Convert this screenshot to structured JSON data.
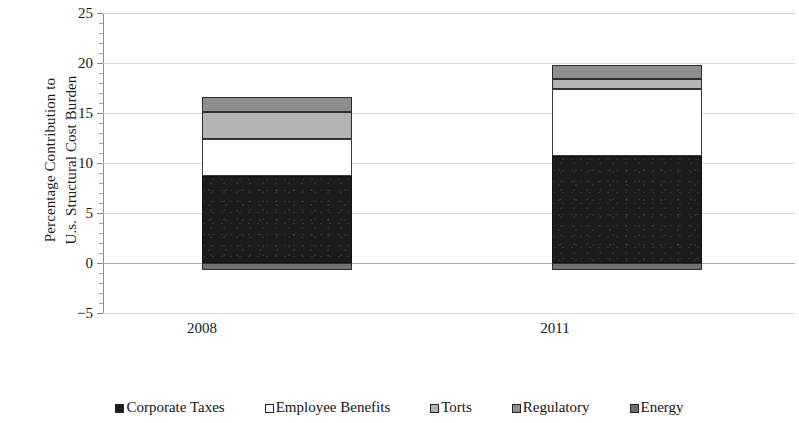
{
  "chart_data": {
    "type": "bar",
    "stacked": true,
    "title": "",
    "subtitle": "",
    "xlabel": "",
    "ylabel": "Percentage Contribution to U.s. Structural Cost Burden",
    "ylabel_lines": [
      "Percentage Contribution to",
      "U.s. Structural Cost Burden"
    ],
    "categories": [
      "2008",
      "2011"
    ],
    "series": [
      {
        "name": "Corporate Taxes",
        "values": [
          8.7,
          10.7
        ],
        "color": "#1c1c1c"
      },
      {
        "name": "Employee Benefits",
        "values": [
          3.7,
          6.7
        ],
        "color": "#ffffff"
      },
      {
        "name": "Torts",
        "values": [
          2.7,
          1.0
        ],
        "color": "#b3b3b3"
      },
      {
        "name": "Regulatory",
        "values": [
          1.5,
          1.4
        ],
        "color": "#8f8f8f"
      },
      {
        "name": "Energy",
        "values": [
          -0.7,
          -0.7
        ],
        "color": "#707070"
      }
    ],
    "totals_positive": [
      16.6,
      19.8
    ],
    "ylim": [
      -5,
      25
    ],
    "ytick_step": 5,
    "ytick_labels": [
      "25",
      "20",
      "15",
      "10",
      "5",
      "0",
      "−5"
    ],
    "ytick_values": [
      25,
      20,
      15,
      10,
      5,
      0,
      -5
    ],
    "minor_ticks_per_interval": 5,
    "grid": true,
    "grid_axis": "y",
    "legend_position": "bottom",
    "legend_entries": [
      {
        "label": "Corporate Taxes",
        "swatch": "corporate"
      },
      {
        "label": "Employee Benefits",
        "swatch": "employee"
      },
      {
        "label": "Torts",
        "swatch": "torts"
      },
      {
        "label": "Regulatory",
        "swatch": "regulatory"
      },
      {
        "label": "Energy",
        "swatch": "energy"
      }
    ]
  }
}
